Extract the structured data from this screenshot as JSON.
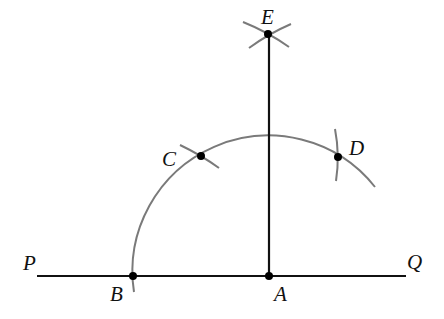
{
  "diagram": {
    "colors": {
      "line": "#111111",
      "arc": "#7a7a7a",
      "point": "#000000",
      "background": "#ffffff"
    },
    "points": {
      "P": {
        "label": "P"
      },
      "Q": {
        "label": "Q"
      },
      "A": {
        "label": "A"
      },
      "B": {
        "label": "B"
      },
      "C": {
        "label": "C"
      },
      "D": {
        "label": "D"
      },
      "E": {
        "label": "E"
      }
    },
    "segments": [
      "PQ",
      "AE"
    ],
    "arcs": [
      "arc centered at A through B, C, D",
      "construction arc marks at C, D, E"
    ]
  }
}
